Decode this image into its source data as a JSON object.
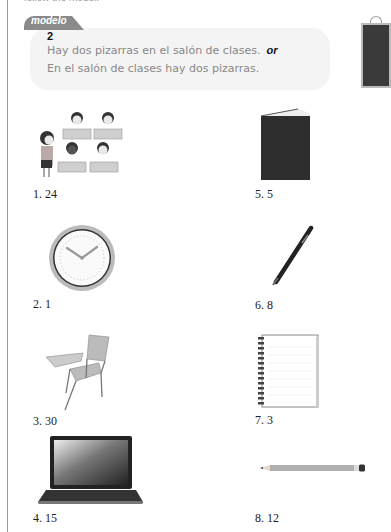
{
  "header": {
    "instruction_cut": "follow the model."
  },
  "model": {
    "tab_label": "modelo",
    "number": "2",
    "line1": "Hay dos pizarras en el salón de clases.",
    "or_label": "or",
    "line2": "En el salón de clases hay dos pizarras.",
    "image": "chalkboard-icon"
  },
  "items": [
    {
      "label": "1. 24",
      "image": "classroom-students-teacher"
    },
    {
      "label": "2. 1",
      "image": "clock-icon"
    },
    {
      "label": "3. 30",
      "image": "student-desk-chair"
    },
    {
      "label": "4. 15",
      "image": "laptop-icon"
    },
    {
      "label": "5. 5",
      "image": "book-icon"
    },
    {
      "label": "6. 8",
      "image": "pen-icon"
    },
    {
      "label": "7. 3",
      "image": "notebook-icon"
    },
    {
      "label": "8. 12",
      "image": "pencil-icon"
    }
  ]
}
